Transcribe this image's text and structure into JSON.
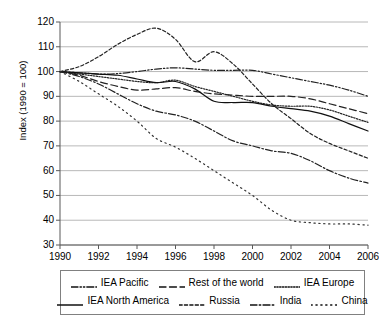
{
  "chart_data": {
    "type": "line",
    "title": "",
    "xlabel": "",
    "ylabel": "Index (1990 = 100)",
    "xlim": [
      1990,
      2006
    ],
    "ylim": [
      30,
      120
    ],
    "yticks": [
      30,
      40,
      50,
      60,
      70,
      80,
      90,
      100,
      110,
      120
    ],
    "xticks": [
      1990,
      1992,
      1994,
      1996,
      1998,
      2000,
      2002,
      2004,
      2006
    ],
    "grid": "horizontal",
    "legend_position": "bottom",
    "x": [
      1990,
      1991,
      1992,
      1993,
      1994,
      1995,
      1996,
      1997,
      1998,
      1999,
      2000,
      2001,
      2002,
      2003,
      2004,
      2005,
      2006
    ],
    "series": [
      {
        "name": "IEA Pacific",
        "style": "dash-dot-dot",
        "color": "#222222",
        "values": [
          100,
          99.5,
          99,
          99.2,
          100,
          101,
          101.5,
          101,
          100.5,
          100.5,
          100.5,
          99,
          97.5,
          96,
          94.5,
          92.5,
          90
        ]
      },
      {
        "name": "Rest of the world",
        "style": "long-dash",
        "color": "#222222",
        "values": [
          100,
          98.5,
          96,
          94,
          92.5,
          93,
          93.5,
          92,
          91,
          90.5,
          90,
          90,
          90,
          89,
          87,
          85,
          83
        ]
      },
      {
        "name": "IEA Europe",
        "style": "dotted",
        "color": "#222222",
        "values": [
          100,
          99,
          98,
          97,
          96,
          95.5,
          96.5,
          94,
          92,
          90,
          88,
          86.5,
          86,
          86,
          84.5,
          82,
          79.5
        ]
      },
      {
        "name": "IEA North America",
        "style": "solid",
        "color": "#111111",
        "values": [
          100,
          99.5,
          99,
          98.5,
          97,
          95.5,
          96,
          93,
          88,
          87.5,
          87.5,
          86,
          85,
          84,
          82,
          79,
          76
        ]
      },
      {
        "name": "Russia",
        "style": "short-dash",
        "color": "#222222",
        "values": [
          100,
          102,
          106,
          111,
          115,
          117.5,
          113,
          104,
          108,
          103,
          95,
          87,
          81,
          75,
          71,
          68,
          65
        ]
      },
      {
        "name": "India",
        "style": "dash-dot",
        "color": "#222222",
        "values": [
          100,
          98,
          95,
          91,
          87,
          84,
          82.5,
          80,
          76,
          72,
          70,
          68,
          67,
          64,
          60,
          57,
          55
        ]
      },
      {
        "name": "China",
        "style": "sparse-dotted",
        "color": "#333333",
        "values": [
          100,
          96,
          91,
          86,
          80,
          73,
          69.5,
          65,
          60,
          55,
          50,
          44,
          40,
          39,
          38.5,
          38.5,
          38
        ]
      }
    ]
  },
  "legend": {
    "rows": [
      [
        {
          "label": "IEA Pacific",
          "style": "dash-dot-dot"
        },
        {
          "label": "Rest of the world",
          "style": "long-dash"
        },
        {
          "label": "IEA Europe",
          "style": "dotted"
        }
      ],
      [
        {
          "label": "IEA North America",
          "style": "solid"
        },
        {
          "label": "Russia",
          "style": "short-dash"
        },
        {
          "label": "India",
          "style": "dash-dot"
        },
        {
          "label": "China",
          "style": "sparse-dotted"
        }
      ]
    ]
  }
}
